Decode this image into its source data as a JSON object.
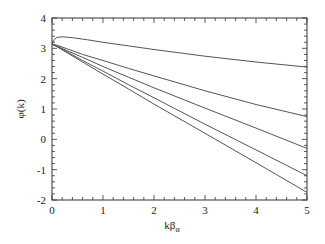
{
  "chart_data": {
    "type": "line",
    "title": "",
    "xlabel": "kβ",
    "xlabel_subscript": "α",
    "ylabel": "φ(k)",
    "xlim": [
      0,
      5
    ],
    "ylim": [
      -2,
      4
    ],
    "xticks": [
      0,
      1,
      2,
      3,
      4,
      5
    ],
    "yticks": [
      -2,
      -1,
      0,
      1,
      2,
      3,
      4
    ],
    "xtick_labels": [
      "0",
      "1",
      "2",
      "3",
      "4",
      "5"
    ],
    "ytick_labels": [
      "-2",
      "-1",
      "0",
      "1",
      "2",
      "3",
      "4"
    ],
    "grid": false,
    "legend": null,
    "series": [
      {
        "name": "curve-1",
        "x": [
          0,
          0.05,
          0.1,
          0.2,
          0.4,
          0.7,
          1,
          1.5,
          2,
          3,
          4,
          5
        ],
        "y": [
          3.14,
          3.3,
          3.36,
          3.38,
          3.35,
          3.28,
          3.2,
          3.08,
          2.96,
          2.74,
          2.55,
          2.38
        ]
      },
      {
        "name": "curve-2",
        "x": [
          0,
          0.1,
          0.3,
          0.6,
          1,
          1.5,
          2,
          3,
          4,
          5
        ],
        "y": [
          3.14,
          3.1,
          2.98,
          2.8,
          2.6,
          2.34,
          2.09,
          1.6,
          1.15,
          0.75
        ]
      },
      {
        "name": "curve-3",
        "x": [
          0,
          0.1,
          0.3,
          0.6,
          1,
          1.5,
          2,
          3,
          4,
          5
        ],
        "y": [
          3.14,
          3.07,
          2.92,
          2.7,
          2.4,
          2.05,
          1.7,
          1.03,
          0.37,
          -0.3
        ]
      },
      {
        "name": "curve-4",
        "x": [
          0,
          0.1,
          0.3,
          0.6,
          1,
          1.5,
          2,
          3,
          4,
          5
        ],
        "y": [
          3.14,
          3.06,
          2.88,
          2.6,
          2.25,
          1.8,
          1.37,
          0.5,
          -0.35,
          -1.2
        ]
      },
      {
        "name": "curve-5",
        "x": [
          0,
          0.1,
          0.3,
          0.6,
          1,
          1.5,
          2,
          3,
          4,
          5
        ],
        "y": [
          3.14,
          3.05,
          2.85,
          2.55,
          2.15,
          1.66,
          1.16,
          0.2,
          -0.77,
          -1.75
        ]
      }
    ],
    "line_color": "#555555",
    "axis_color": "#333333"
  }
}
